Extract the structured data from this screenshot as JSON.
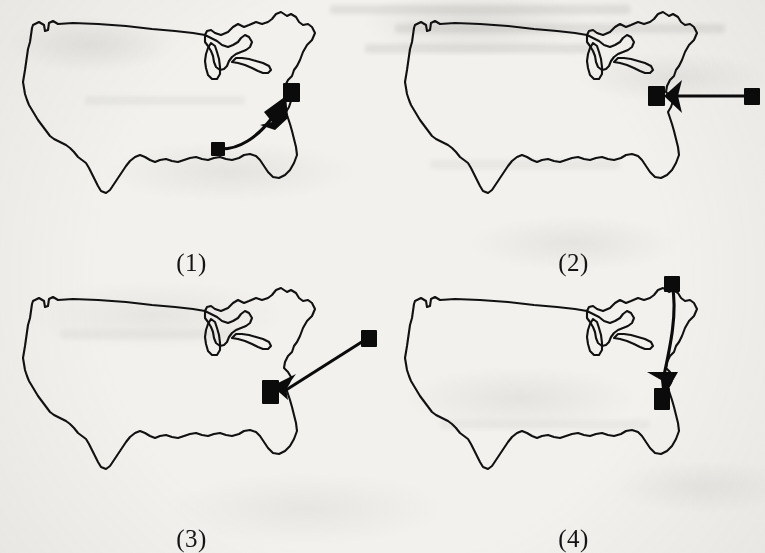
{
  "figure": {
    "kind": "scanned-book-figure",
    "background_color": "#f2f1ee",
    "ink_color": "#111111",
    "panel_count": 4,
    "grid": {
      "columns": 2,
      "rows": 2
    }
  },
  "panels": [
    {
      "id": "panel-1",
      "label": "(1)",
      "map_name": "united-states-outline",
      "annotation": {
        "type": "curved-arrow",
        "direction": "up-and-to-the-right",
        "tail_marker": "filled-square",
        "head_marker": "filled-triangle-arrowhead",
        "target_marker": "filled-square",
        "tail_point": {
          "x": 0.565,
          "y": 0.615
        },
        "head_point": {
          "x": 0.745,
          "y": 0.425
        },
        "target_point": {
          "x": 0.775,
          "y": 0.375
        }
      }
    },
    {
      "id": "panel-2",
      "label": "(2)",
      "map_name": "united-states-outline",
      "annotation": {
        "type": "straight-arrow",
        "direction": "leftward-horizontal",
        "tail_marker": "filled-square",
        "head_marker": "filled-triangle-arrowhead",
        "target_marker": "filled-square",
        "tail_point": {
          "x": 0.985,
          "y": 0.4
        },
        "head_point": {
          "x": 0.79,
          "y": 0.4
        },
        "target_point": {
          "x": 0.762,
          "y": 0.405
        }
      }
    },
    {
      "id": "panel-3",
      "label": "(3)",
      "map_name": "united-states-outline",
      "annotation": {
        "type": "straight-arrow",
        "direction": "down-and-to-the-left",
        "tail_marker": "filled-square",
        "head_marker": "filled-triangle-arrowhead",
        "target_marker": "filled-square",
        "tail_point": {
          "x": 0.985,
          "y": 0.258
        },
        "head_point": {
          "x": 0.752,
          "y": 0.47
        },
        "target_point": {
          "x": 0.735,
          "y": 0.487
        }
      }
    },
    {
      "id": "panel-4",
      "label": "(4)",
      "map_name": "united-states-outline",
      "annotation": {
        "type": "curved-arrow",
        "direction": "downward",
        "tail_marker": "filled-square",
        "head_marker": "filled-triangle-arrowhead",
        "target_marker": "filled-square",
        "tail_point": {
          "x": 0.755,
          "y": 0.055
        },
        "head_point": {
          "x": 0.735,
          "y": 0.44
        },
        "target_point": {
          "x": 0.735,
          "y": 0.5
        }
      }
    }
  ]
}
